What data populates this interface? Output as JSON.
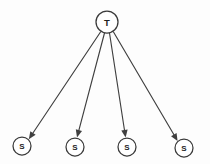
{
  "diagram": {
    "type": "star-topology-directed-graph",
    "background_color": "#fdfdfd",
    "stroke_color": "#3a3a3a",
    "edge_color": "#3f3f3f",
    "label_color": "#1f1f1f",
    "root": {
      "id": "T",
      "label": "T",
      "cx": 107,
      "cy": 22,
      "r": 11
    },
    "leaves": [
      {
        "id": "S1",
        "label": "S",
        "cx": 22,
        "cy": 146,
        "r": 9
      },
      {
        "id": "S2",
        "label": "S",
        "cx": 75,
        "cy": 147,
        "r": 9
      },
      {
        "id": "S3",
        "label": "S",
        "cx": 127,
        "cy": 147,
        "r": 9
      },
      {
        "id": "S4",
        "label": "S",
        "cx": 184,
        "cy": 148,
        "r": 9
      }
    ],
    "edges": [
      {
        "id": "E1",
        "from": "T",
        "to": "S1",
        "x1": 100.5,
        "y1": 32.0,
        "x2": 28.8,
        "y2": 139.2,
        "directed": true
      },
      {
        "id": "E2",
        "from": "T",
        "to": "S2",
        "x1": 104.5,
        "y1": 33.0,
        "x2": 77.0,
        "y2": 137.4,
        "directed": true
      },
      {
        "id": "E3",
        "from": "T",
        "to": "S3",
        "x1": 109.5,
        "y1": 33.0,
        "x2": 125.6,
        "y2": 137.4,
        "directed": true
      },
      {
        "id": "E4",
        "from": "T",
        "to": "S4",
        "x1": 113.5,
        "y1": 32.0,
        "x2": 177.6,
        "y2": 141.0,
        "directed": true
      }
    ]
  }
}
